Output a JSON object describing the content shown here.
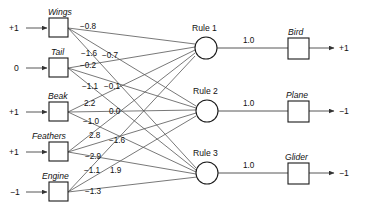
{
  "diagram": {
    "type": "feedforward-network",
    "colors": {
      "background": "#ffffff",
      "node_stroke": "#1a1a1a",
      "edge": "#555555",
      "text": "#111111"
    },
    "input_layer": {
      "nodes": [
        {
          "id": "wings",
          "label": "Wings",
          "input_value": "+1"
        },
        {
          "id": "tail",
          "label": "Tail",
          "input_value": "0"
        },
        {
          "id": "beak",
          "label": "Beak",
          "input_value": "+1"
        },
        {
          "id": "feathers",
          "label": "Feathers",
          "input_value": "+1"
        },
        {
          "id": "engine",
          "label": "Engine",
          "input_value": "−1"
        }
      ]
    },
    "hidden_layer": {
      "nodes": [
        {
          "id": "rule1",
          "label": "Rule 1"
        },
        {
          "id": "rule2",
          "label": "Rule 2"
        },
        {
          "id": "rule3",
          "label": "Rule 3"
        }
      ]
    },
    "output_layer": {
      "nodes": [
        {
          "id": "bird",
          "label": "Bird",
          "output_value": "+1"
        },
        {
          "id": "plane",
          "label": "Plane",
          "output_value": "−1"
        },
        {
          "id": "glider",
          "label": "Glider",
          "output_value": "−1"
        }
      ]
    },
    "input_weights": [
      {
        "from": "wings",
        "to": "rule1",
        "label": "−0.8",
        "x": 80,
        "y": 29
      },
      {
        "from": "wings",
        "to": "rule2",
        "label": "−1.6",
        "x": 81,
        "y": 56
      },
      {
        "from": "wings",
        "to": "rule3",
        "label": "−0.7",
        "x": 102,
        "y": 58
      },
      {
        "from": "tail",
        "to": "rule1",
        "label": "−0.2",
        "x": 80,
        "y": 68
      },
      {
        "from": "tail",
        "to": "rule2",
        "label": "−1.1",
        "x": 82,
        "y": 89
      },
      {
        "from": "tail",
        "to": "rule3",
        "label": "−0.1",
        "x": 104,
        "y": 89
      },
      {
        "from": "beak",
        "to": "rule1",
        "label": "2.2",
        "x": 84,
        "y": 106
      },
      {
        "from": "beak",
        "to": "rule2",
        "label": "0.0",
        "x": 109,
        "y": 114
      },
      {
        "from": "beak",
        "to": "rule3",
        "label": "−1.0",
        "x": 83,
        "y": 124
      },
      {
        "from": "feathers",
        "to": "rule1",
        "label": "2.8",
        "x": 89,
        "y": 138
      },
      {
        "from": "feathers",
        "to": "rule2",
        "label": "−1.6",
        "x": 109,
        "y": 143
      },
      {
        "from": "feathers",
        "to": "rule3",
        "label": "−2.9",
        "x": 85,
        "y": 159
      },
      {
        "from": "engine",
        "to": "rule1",
        "label": "−1.1",
        "x": 84,
        "y": 173
      },
      {
        "from": "engine",
        "to": "rule2",
        "label": "1.9",
        "x": 110,
        "y": 173
      },
      {
        "from": "engine",
        "to": "rule3",
        "label": "−1.3",
        "x": 85,
        "y": 194
      }
    ],
    "output_weights": [
      {
        "from": "rule1",
        "to": "bird",
        "label": "1.0"
      },
      {
        "from": "rule2",
        "to": "plane",
        "label": "1.0"
      },
      {
        "from": "rule3",
        "to": "glider",
        "label": "1.0"
      }
    ]
  }
}
